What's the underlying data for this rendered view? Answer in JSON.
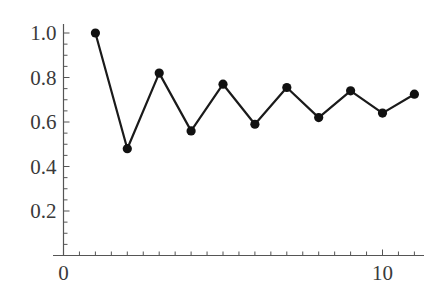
{
  "chart_data": {
    "type": "line",
    "title": "",
    "xlabel": "",
    "ylabel": "",
    "x": [
      1,
      2,
      3,
      4,
      5,
      6,
      7,
      8,
      9,
      10,
      11
    ],
    "series": [
      {
        "name": "sequence",
        "values": [
          1.0,
          0.48,
          0.82,
          0.56,
          0.77,
          0.59,
          0.755,
          0.62,
          0.74,
          0.64,
          0.725
        ],
        "marker": "circle",
        "color": "#111111"
      }
    ],
    "xlim": [
      0,
      11.3
    ],
    "ylim": [
      0,
      1.0
    ],
    "x_ticks_major": [
      0,
      10
    ],
    "x_tick_labels": [
      "0",
      "10"
    ],
    "x_ticks_minor_step": 0.5,
    "y_ticks_major": [
      0.2,
      0.4,
      0.6,
      0.8,
      1.0
    ],
    "y_tick_labels": [
      "0.2",
      "0.4",
      "0.6",
      "0.8",
      "1.0"
    ],
    "y_ticks_minor_step": 0.05,
    "grid": false,
    "legend": null
  }
}
